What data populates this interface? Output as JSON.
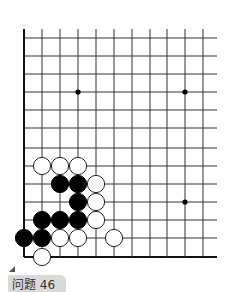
{
  "problem": {
    "label": "问题 46"
  },
  "board": {
    "columns_x": [
      24,
      42,
      60,
      78,
      96,
      114,
      132,
      150,
      167,
      185,
      203
    ],
    "rows_y": [
      38,
      56,
      74,
      92,
      110,
      128,
      148,
      166,
      184,
      202,
      220,
      238,
      257
    ],
    "line_right_end": 217,
    "line_top_start": 29,
    "left_edge_x": 24,
    "bottom_edge_y": 257,
    "star_points": [
      {
        "x": 78,
        "y": 92
      },
      {
        "x": 185,
        "y": 92
      },
      {
        "x": 185,
        "y": 202
      }
    ],
    "stones": [
      {
        "color": "white",
        "x": 42,
        "y": 166
      },
      {
        "color": "white",
        "x": 60,
        "y": 166
      },
      {
        "color": "white",
        "x": 78,
        "y": 166
      },
      {
        "color": "black",
        "x": 60,
        "y": 184
      },
      {
        "color": "black",
        "x": 78,
        "y": 184
      },
      {
        "color": "white",
        "x": 96,
        "y": 184
      },
      {
        "color": "black",
        "x": 78,
        "y": 202
      },
      {
        "color": "white",
        "x": 96,
        "y": 202
      },
      {
        "color": "black",
        "x": 42,
        "y": 220
      },
      {
        "color": "black",
        "x": 60,
        "y": 220
      },
      {
        "color": "black",
        "x": 78,
        "y": 220
      },
      {
        "color": "white",
        "x": 96,
        "y": 220
      },
      {
        "color": "black",
        "x": 24,
        "y": 238
      },
      {
        "color": "black",
        "x": 42,
        "y": 238
      },
      {
        "color": "white",
        "x": 60,
        "y": 238
      },
      {
        "color": "white",
        "x": 78,
        "y": 238
      },
      {
        "color": "white",
        "x": 114,
        "y": 238
      },
      {
        "color": "white",
        "x": 42,
        "y": 257
      }
    ],
    "colors": {
      "line": "#333333",
      "edge": "#111111",
      "black_stone": "#000000",
      "white_stone": "#ffffff",
      "white_stroke": "#222222"
    }
  }
}
